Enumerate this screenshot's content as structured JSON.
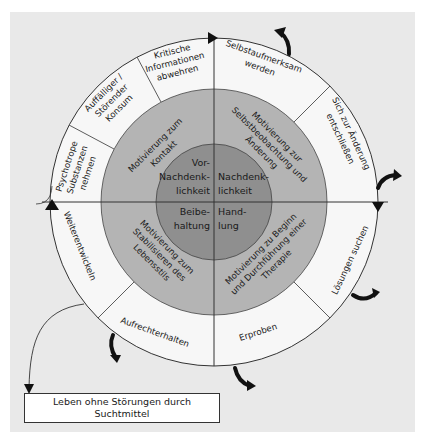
{
  "colors": {
    "background_panel": "#e9e9e9",
    "outer_ring": "#f7f7f7",
    "middle_ring": "#b4b4b4",
    "inner_circle": "#8f8f8f",
    "lines": "#333333",
    "arrows": "#111111"
  },
  "inner_circle": {
    "top_left": [
      "Vor-",
      "Nachdenk-",
      "lichkeit"
    ],
    "top_right": [
      "Nachdenk-",
      "lichkeit"
    ],
    "bottom_left": [
      "Beibe-",
      "haltung"
    ],
    "bottom_right": [
      "Hand-",
      "lung"
    ]
  },
  "middle_ring": {
    "top_left": [
      "Motivierung zum",
      "Kontakt"
    ],
    "top_right": [
      "Motivierung zur",
      "Selbstbeobachtung und",
      "Änderung"
    ],
    "bottom_left": [
      "Motivierung zum",
      "Stabilisieren des",
      "Lebensstils"
    ],
    "bottom_right": [
      "Motivierung zu Beginn",
      "und Durchführung einer",
      "Therapie"
    ]
  },
  "outer_ring": {
    "segments": [
      {
        "id": "psychotrope",
        "lines": [
          "Psychotrope",
          "Substanzen",
          "nehmen"
        ]
      },
      {
        "id": "auffaelliger",
        "lines": [
          "Auffälliger /",
          "Störender",
          "Konsum"
        ]
      },
      {
        "id": "kritische",
        "lines": [
          "Kritische",
          "Informationen",
          "abwehren"
        ]
      },
      {
        "id": "selbstaufmerksam",
        "lines": [
          "Selbstaufmerksam",
          "werden"
        ]
      },
      {
        "id": "aenderung",
        "lines": [
          "Sich zur Änderung",
          "entschließen"
        ]
      },
      {
        "id": "loesungen",
        "lines": [
          "Lösungen suchen"
        ]
      },
      {
        "id": "erproben",
        "lines": [
          "Erproben"
        ]
      },
      {
        "id": "aufrechterhalten",
        "lines": [
          "Aufrechterhalten"
        ]
      },
      {
        "id": "weiterentwickeln",
        "lines": [
          "Weiterentwickeln"
        ]
      }
    ]
  },
  "result_box": {
    "line1": "Leben ohne Störungen durch",
    "line2": "Suchtmittel"
  }
}
